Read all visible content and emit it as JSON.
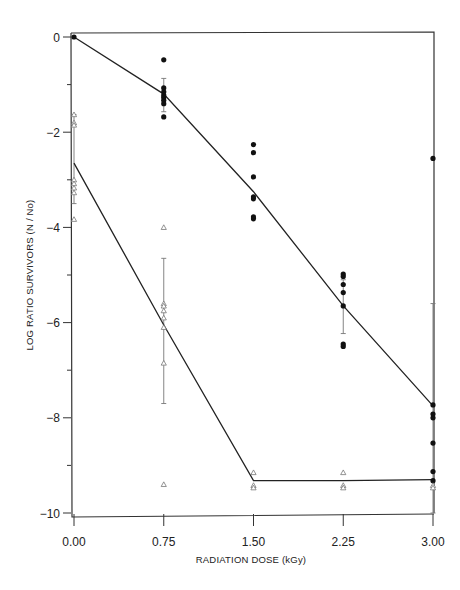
{
  "chart_data": {
    "type": "scatter",
    "title": "",
    "xlabel": "RADIATION DOSE (kGy)",
    "ylabel": "LOG RATIO SURVIVORS (N / No)",
    "xlim": [
      0,
      3
    ],
    "ylim": [
      -10,
      0
    ],
    "x_ticks": [
      "0.00",
      "0.75",
      "1.50",
      "2.25",
      "3.00"
    ],
    "x_tick_values": [
      0,
      0.75,
      1.5,
      2.25,
      3.0
    ],
    "y_ticks": [
      "0",
      "-2",
      "-4",
      "-6",
      "-8",
      "-10"
    ],
    "y_tick_values": [
      0,
      -2,
      -4,
      -6,
      -8,
      -10
    ],
    "y_minor_ticks": [
      -1,
      -3,
      -5,
      -7,
      -9
    ],
    "grid": false,
    "legend": null,
    "series": [
      {
        "name": "filled circles",
        "marker": "circle-filled",
        "points": [
          [
            0,
            0
          ],
          [
            0.75,
            -0.48
          ],
          [
            0.75,
            -1.07
          ],
          [
            0.75,
            -1.15
          ],
          [
            0.75,
            -1.22
          ],
          [
            0.75,
            -1.27
          ],
          [
            0.75,
            -1.33
          ],
          [
            0.75,
            -1.4
          ],
          [
            0.75,
            -1.68
          ],
          [
            1.5,
            -2.26
          ],
          [
            1.5,
            -2.43
          ],
          [
            1.5,
            -2.94
          ],
          [
            1.5,
            -3.36
          ],
          [
            1.5,
            -3.4
          ],
          [
            1.5,
            -3.78
          ],
          [
            1.5,
            -3.82
          ],
          [
            2.25,
            -4.98
          ],
          [
            2.25,
            -5.03
          ],
          [
            2.25,
            -5.2
          ],
          [
            2.25,
            -5.37
          ],
          [
            2.25,
            -5.65
          ],
          [
            2.25,
            -6.45
          ],
          [
            2.25,
            -6.5
          ],
          [
            3.0,
            -2.55
          ],
          [
            3.0,
            -7.73
          ],
          [
            3.0,
            -7.92
          ],
          [
            3.0,
            -8.0
          ],
          [
            3.0,
            -8.53
          ],
          [
            3.0,
            -9.13
          ],
          [
            3.0,
            -9.32
          ]
        ],
        "error_bars": [
          {
            "x": 0.75,
            "low": -1.57,
            "high": -0.87
          },
          {
            "x": 2.25,
            "low": -6.23,
            "high": -5.1
          },
          {
            "x": 3.0,
            "low": -10.0,
            "high": -5.6
          }
        ],
        "fit_line": [
          [
            0,
            0
          ],
          [
            0.75,
            -1.2
          ],
          [
            1.5,
            -3.25
          ],
          [
            2.25,
            -5.65
          ],
          [
            3.0,
            -7.75
          ]
        ]
      },
      {
        "name": "open triangles",
        "marker": "triangle-open",
        "points": [
          [
            0,
            -1.63
          ],
          [
            0,
            -1.8
          ],
          [
            0,
            -1.85
          ],
          [
            0,
            -3.0
          ],
          [
            0,
            -3.08
          ],
          [
            0,
            -3.17
          ],
          [
            0,
            -3.27
          ],
          [
            0,
            -3.83
          ],
          [
            0.75,
            -4.0
          ],
          [
            0.75,
            -5.6
          ],
          [
            0.75,
            -5.65
          ],
          [
            0.75,
            -5.75
          ],
          [
            0.75,
            -5.9
          ],
          [
            0.75,
            -6.1
          ],
          [
            0.75,
            -6.85
          ],
          [
            0.75,
            -9.4
          ],
          [
            1.5,
            -9.15
          ],
          [
            1.5,
            -9.42
          ],
          [
            1.5,
            -9.47
          ],
          [
            2.25,
            -9.15
          ],
          [
            2.25,
            -9.42
          ],
          [
            2.25,
            -9.47
          ],
          [
            3.0,
            -9.42
          ],
          [
            3.0,
            -9.47
          ]
        ],
        "error_bars": [
          {
            "x": 0,
            "low": -3.5,
            "high": -1.63
          },
          {
            "x": 0.75,
            "low": -7.7,
            "high": -4.65
          }
        ],
        "fit_line": [
          [
            0,
            -2.65
          ],
          [
            0.75,
            -6.05
          ],
          [
            1.5,
            -9.32
          ],
          [
            2.25,
            -9.32
          ],
          [
            3.0,
            -9.3
          ]
        ]
      }
    ]
  }
}
